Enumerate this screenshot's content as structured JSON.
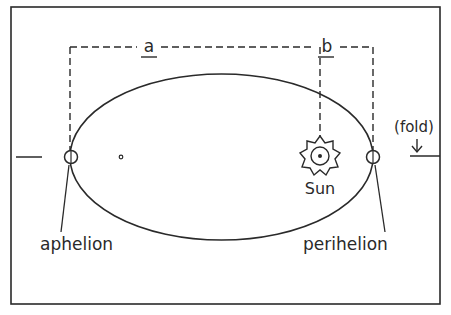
{
  "diagram": {
    "labels": {
      "a": "a",
      "b": "b",
      "sun": "Sun",
      "aphelion": "aphelion",
      "perihelion": "perihelion",
      "fold": "(fold)"
    },
    "colors": {
      "stroke": "#2a2a2a",
      "background": "#ffffff"
    }
  }
}
